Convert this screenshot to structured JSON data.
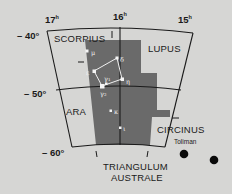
{
  "map": {
    "title": "Norma region star chart",
    "background_color": "#d6d6d4",
    "highlight_color": "#6a6a6a",
    "line_color": "#1a1a1a",
    "ra_labels": [
      {
        "label": "17",
        "unit": "h"
      },
      {
        "label": "16",
        "unit": "h"
      },
      {
        "label": "15",
        "unit": "h"
      }
    ],
    "dec_labels": [
      "– 40°",
      "– 50°",
      "– 60°"
    ],
    "constellations": {
      "scorpius": "SCORPIUS",
      "lupus": "LUPUS",
      "ara": "ARA",
      "circinus": "CIRCINUS",
      "triangulum_line1": "TRIANGULUM",
      "triangulum_line2": "AUSTRALE"
    },
    "stars": [
      {
        "name": "mu",
        "label": "μ"
      },
      {
        "name": "delta",
        "label": "δ"
      },
      {
        "name": "epsilon",
        "label": "ε"
      },
      {
        "name": "gamma1",
        "label": "γ₁"
      },
      {
        "name": "eta",
        "label": "η"
      },
      {
        "name": "gamma2",
        "label": "γ₂"
      },
      {
        "name": "kappa",
        "label": "κ"
      },
      {
        "name": "iota",
        "label": "ι"
      }
    ],
    "notable_star": "Toliman"
  }
}
